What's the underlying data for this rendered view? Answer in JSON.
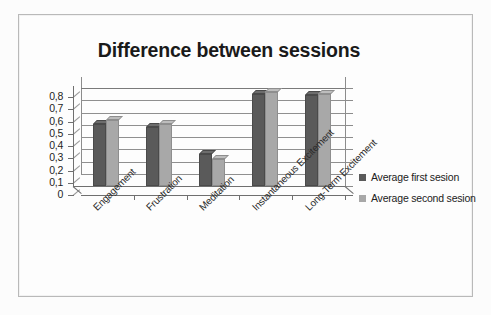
{
  "chart_data": {
    "type": "bar",
    "title": "Difference between sessions",
    "xlabel": "",
    "ylabel": "",
    "ylim": [
      0,
      0.8
    ],
    "grid": true,
    "legend_position": "right",
    "categories": [
      "Engagement",
      "Frustration",
      "Meditation",
      "Instantaneous Excitement",
      "Long-Term Excitement"
    ],
    "ytick_labels": [
      "0,8",
      "0,7",
      "0,6",
      "0,5",
      "0,4",
      "0,3",
      "0,2",
      "0,1",
      "0"
    ],
    "ytick_values": [
      0.8,
      0.7,
      0.6,
      0.5,
      0.4,
      0.3,
      0.2,
      0.1,
      0
    ],
    "series": [
      {
        "name": "Average first sesion",
        "color": "#5a5a5a",
        "values": [
          0.51,
          0.48,
          0.26,
          0.755,
          0.74
        ]
      },
      {
        "name": "Average second sesion",
        "color": "#a8a8a8",
        "values": [
          0.54,
          0.51,
          0.22,
          0.77,
          0.75
        ]
      }
    ]
  },
  "legend": {
    "items": [
      {
        "label": "Average first sesion"
      },
      {
        "label": "Average second sesion"
      }
    ]
  },
  "colors": {
    "series1": "#5a5a5a",
    "series2": "#a8a8a8",
    "axis": "#6f6f6f",
    "grid": "#8f8f8f",
    "frame": "#b9b9b9",
    "background": "#fdfdfd",
    "title": "#1a1a1a"
  }
}
